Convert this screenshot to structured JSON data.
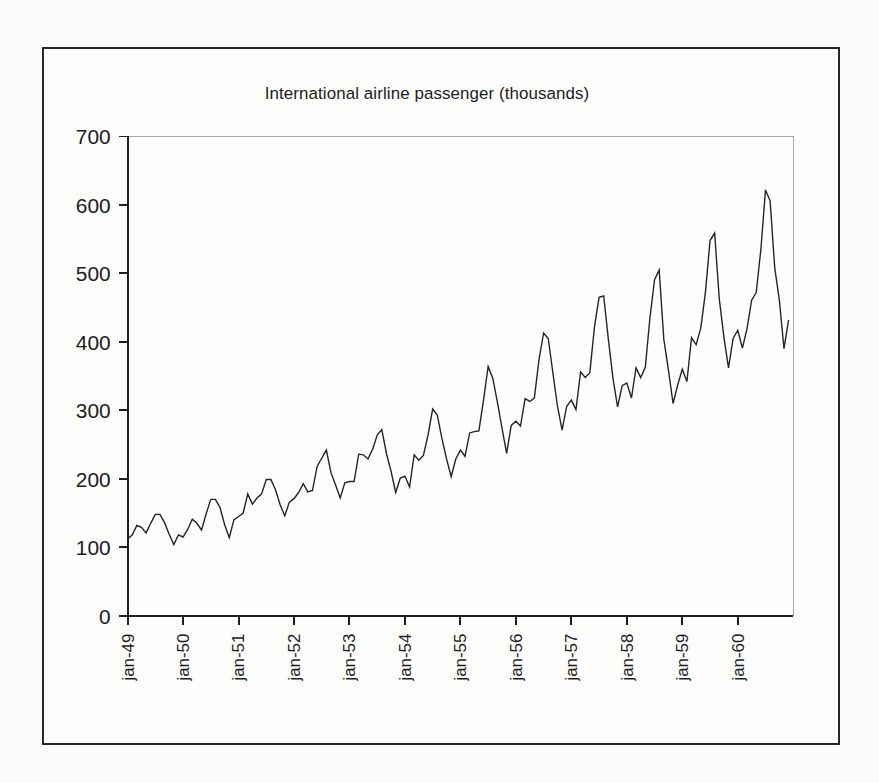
{
  "figure": {
    "title": "International airline passenger (thousands)",
    "background_color": "#fbfbfa",
    "frame_color": "#262626",
    "line_color": "#242424"
  },
  "chart_data": {
    "type": "line",
    "title": "International airline passenger (thousands)",
    "xlabel": "",
    "ylabel": "",
    "ylim": [
      0,
      700
    ],
    "yticks": [
      0,
      100,
      200,
      300,
      400,
      500,
      600,
      700
    ],
    "ytick_labels": [
      "0",
      "100",
      "200",
      "300",
      "400",
      "500",
      "600",
      "700"
    ],
    "xtick_labels": [
      "jan-49",
      "jan-50",
      "jan-51",
      "jan-52",
      "jan-53",
      "jan-54",
      "jan-55",
      "jan-56",
      "jan-57",
      "jan-58",
      "jan-59",
      "jan-60"
    ],
    "xtick_rotation": 90,
    "grid": false,
    "legend": false,
    "x_start": "jan-49",
    "x_end": "dec-60",
    "x_frequency": "monthly",
    "n_points": 144,
    "series": [
      {
        "name": "International airline passengers (thousands)",
        "values": [
          112,
          118,
          132,
          129,
          121,
          135,
          148,
          148,
          136,
          119,
          104,
          118,
          115,
          126,
          141,
          135,
          125,
          149,
          170,
          170,
          158,
          133,
          114,
          140,
          145,
          150,
          178,
          163,
          172,
          178,
          199,
          199,
          184,
          162,
          146,
          166,
          171,
          180,
          193,
          181,
          183,
          218,
          230,
          242,
          209,
          191,
          172,
          194,
          196,
          196,
          236,
          235,
          229,
          243,
          264,
          272,
          237,
          211,
          180,
          201,
          204,
          188,
          235,
          227,
          234,
          264,
          302,
          293,
          259,
          229,
          203,
          229,
          242,
          233,
          267,
          269,
          270,
          315,
          364,
          347,
          312,
          274,
          237,
          278,
          284,
          277,
          317,
          313,
          318,
          374,
          413,
          405,
          355,
          306,
          271,
          306,
          315,
          301,
          356,
          348,
          355,
          422,
          465,
          467,
          404,
          347,
          305,
          336,
          340,
          318,
          362,
          348,
          363,
          435,
          491,
          505,
          404,
          359,
          310,
          337,
          360,
          342,
          406,
          396,
          420,
          472,
          548,
          559,
          463,
          407,
          362,
          405,
          417,
          391,
          419,
          461,
          472,
          535,
          622,
          606,
          508,
          461,
          390,
          432
        ]
      }
    ]
  }
}
